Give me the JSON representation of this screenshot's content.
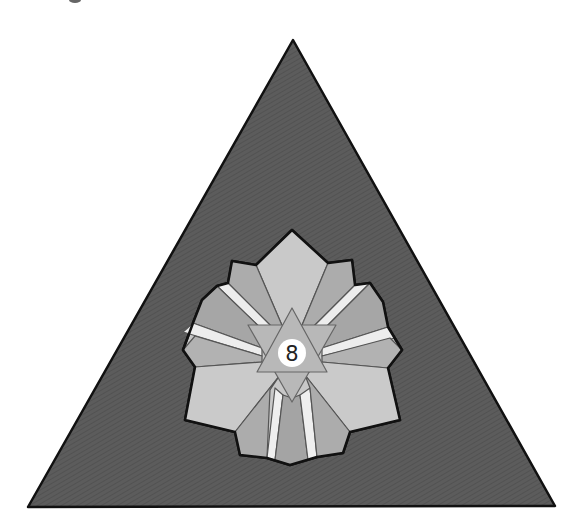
{
  "figure": {
    "center_label": "8",
    "colors": {
      "background": "#ffffff",
      "outer_triangle": "#5a5a5a",
      "outline": "#111111",
      "petal_light": "#c8c8c8",
      "petal_mid": "#a9a9a9",
      "petal_white": "#ececec",
      "inner_triangle": "#b4b4b4",
      "center_circle": "#ffffff",
      "label": "#222222"
    }
  }
}
